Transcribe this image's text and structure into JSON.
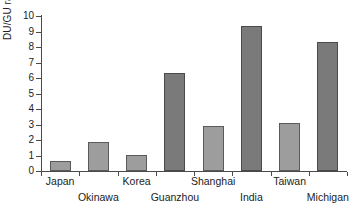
{
  "chart_data": {
    "type": "bar",
    "title": "",
    "xlabel": "",
    "ylabel": "DU/GU ratio",
    "ylim": [
      0,
      10
    ],
    "ytick_labels": [
      "10",
      "9",
      "8",
      "7",
      "6",
      "5",
      "4",
      "3",
      "2",
      "1",
      "0"
    ],
    "ytick_values": [
      10,
      9,
      8,
      7,
      6,
      5,
      4,
      3,
      2,
      1,
      0
    ],
    "grid": false,
    "legend": "none",
    "categories": [
      "Japan",
      "Okinawa",
      "Korea",
      "Guanzhou",
      "Shanghai",
      "India",
      "Taiwan",
      "Michigan"
    ],
    "values": [
      0.65,
      1.9,
      1.05,
      6.3,
      2.9,
      9.35,
      3.1,
      8.3
    ],
    "bars": [
      {
        "label": "Japan",
        "value": 0.65,
        "shade": "light"
      },
      {
        "label": "Okinawa",
        "value": 1.9,
        "shade": "light"
      },
      {
        "label": "Korea",
        "value": 1.05,
        "shade": "light"
      },
      {
        "label": "Guanzhou",
        "value": 6.3,
        "shade": "dark"
      },
      {
        "label": "Shanghai",
        "value": 2.9,
        "shade": "light"
      },
      {
        "label": "India",
        "value": 9.35,
        "shade": "dark"
      },
      {
        "label": "Taiwan",
        "value": 3.1,
        "shade": "light"
      },
      {
        "label": "Michigan",
        "value": 8.3,
        "shade": "dark"
      }
    ],
    "colors": {
      "light_bar": "#9d9d9d",
      "dark_bar": "#7a7a7a",
      "axis": "#4a4a4a",
      "text": "#222222",
      "background": "#ffffff"
    }
  }
}
